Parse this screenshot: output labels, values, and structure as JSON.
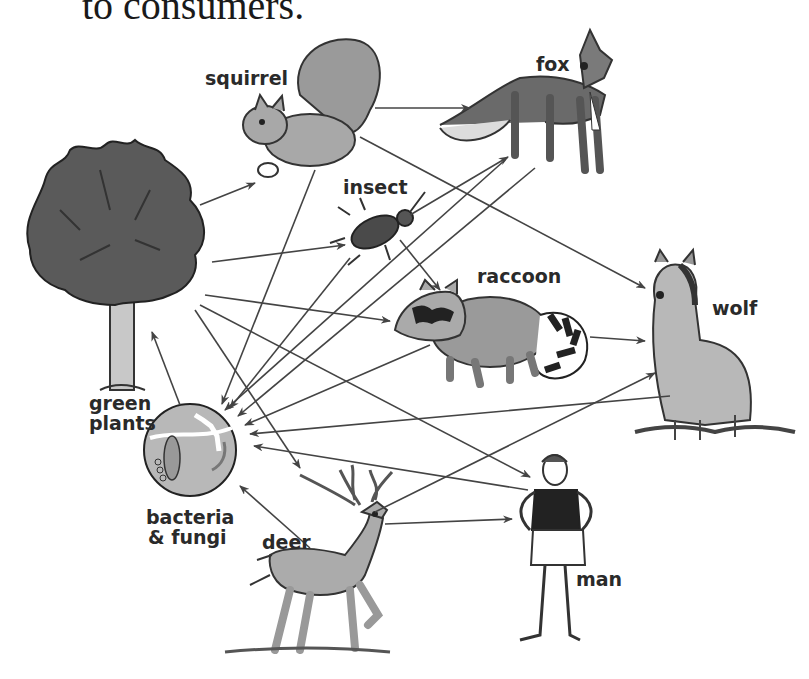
{
  "caption": "to consumers.",
  "organisms": {
    "green_plants": {
      "line1": "green",
      "line2": "plants"
    },
    "squirrel": "squirrel",
    "fox": "fox",
    "insect": "insect",
    "raccoon": "raccoon",
    "wolf": "wolf",
    "bacteria_fungi": {
      "line1": "bacteria",
      "line2": "& fungi"
    },
    "deer": "deer",
    "man": "man"
  },
  "arrows": [
    {
      "from": "green plants",
      "to": "squirrel"
    },
    {
      "from": "green plants",
      "to": "insect"
    },
    {
      "from": "green plants",
      "to": "raccoon"
    },
    {
      "from": "green plants",
      "to": "deer"
    },
    {
      "from": "green plants",
      "to": "man"
    },
    {
      "from": "squirrel",
      "to": "fox"
    },
    {
      "from": "squirrel",
      "to": "wolf"
    },
    {
      "from": "insect",
      "to": "raccoon"
    },
    {
      "from": "insect",
      "to": "fox"
    },
    {
      "from": "raccoon",
      "to": "wolf"
    },
    {
      "from": "deer",
      "to": "wolf"
    },
    {
      "from": "deer",
      "to": "man"
    },
    {
      "from": "deer",
      "to": "bacteria & fungi"
    },
    {
      "from": "squirrel",
      "to": "bacteria & fungi"
    },
    {
      "from": "insect",
      "to": "bacteria & fungi"
    },
    {
      "from": "fox",
      "to": "bacteria & fungi"
    },
    {
      "from": "raccoon",
      "to": "bacteria & fungi"
    },
    {
      "from": "wolf",
      "to": "bacteria & fungi"
    },
    {
      "from": "man",
      "to": "bacteria & fungi"
    },
    {
      "from": "bacteria & fungi",
      "to": "green plants"
    }
  ],
  "colors": {
    "line": "#444444",
    "fill_dark": "#555555",
    "fill_mid": "#8a8a8a",
    "fill_light": "#bdbdbd",
    "label": "#2a2a2a"
  }
}
